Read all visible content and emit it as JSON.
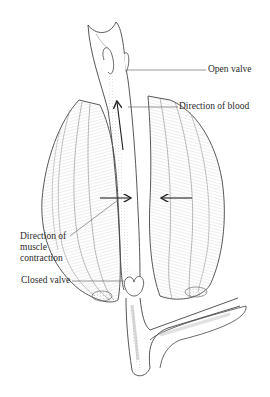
{
  "figure": {
    "colors": {
      "ink": "#2a2a2a",
      "line": "#555555",
      "background": "#ffffff",
      "shade": "#bdbdbd"
    },
    "labels": {
      "open_valve": "Open valve",
      "direction_of_blood": "Direction of blood",
      "direction_of_muscle_contraction_line1": "Direction of",
      "direction_of_muscle_contraction_line2": "muscle",
      "direction_of_muscle_contraction_line3": "contraction",
      "closed_valve": "Closed valve"
    }
  }
}
